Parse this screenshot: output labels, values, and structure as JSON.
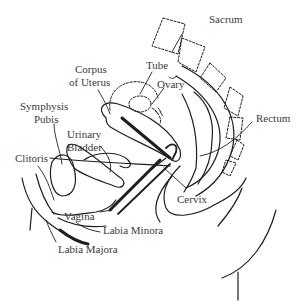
{
  "diagram": {
    "style": {
      "line_color": "#1e1e1e",
      "label_color": "#3a3a3a",
      "background": "#ffffff"
    },
    "labels": [
      {
        "id": "sacrum",
        "text": "Sacrum",
        "x": 209,
        "y": 19
      },
      {
        "id": "corpus_uterus_1",
        "text": "Corpus",
        "x": 75,
        "y": 62
      },
      {
        "id": "corpus_uterus_2",
        "text": "of Uterus",
        "x": 70,
        "y": 75
      },
      {
        "id": "tube",
        "text": "Tube",
        "x": 146,
        "y": 60
      },
      {
        "id": "ovary",
        "text": "Ovary",
        "x": 156,
        "y": 78
      },
      {
        "id": "symphysis_pubis_1",
        "text": "Symphysis",
        "x": 21,
        "y": 99
      },
      {
        "id": "symphysis_pubis_2",
        "text": "Pubis",
        "x": 33,
        "y": 112
      },
      {
        "id": "urinary_bladder_1",
        "text": "Urinary",
        "x": 67,
        "y": 127
      },
      {
        "id": "urinary_bladder_2",
        "text": "Bladder",
        "x": 67,
        "y": 140
      },
      {
        "id": "rectum",
        "text": "Rectum",
        "x": 256,
        "y": 112
      },
      {
        "id": "clitoris",
        "text": "Clitoris",
        "x": 15,
        "y": 154
      },
      {
        "id": "cervix",
        "text": "Cervix",
        "x": 176,
        "y": 193
      },
      {
        "id": "vagina",
        "text": "Vagina",
        "x": 64,
        "y": 210
      },
      {
        "id": "labia_minora",
        "text": "Labia Minora",
        "x": 103,
        "y": 229
      },
      {
        "id": "labia_majora",
        "text": "Labia Majora",
        "x": 58,
        "y": 244
      }
    ]
  }
}
